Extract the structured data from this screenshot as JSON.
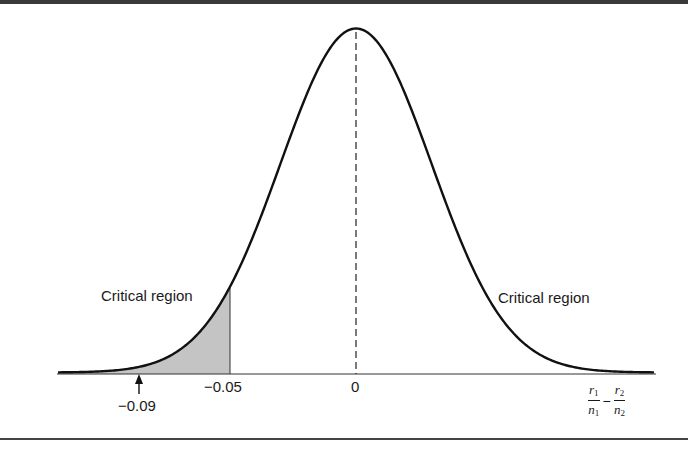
{
  "figure": {
    "colors": {
      "curve": "#111111",
      "shade": "#c4c4c4",
      "axis": "#333333",
      "border": "#444444",
      "text": "#1a1a1a"
    }
  },
  "labels": {
    "critical_left": "Critical region",
    "critical_right": "Critical region",
    "tick_zero": "0",
    "tick_cutoff": "−0.05",
    "arrow_value": "−0.09",
    "xlabel": {
      "r1": "r",
      "sub1": "1",
      "n1": "n",
      "subn1": "1",
      "minus": "−",
      "r2": "r",
      "sub2": "2",
      "n2": "n",
      "subn2": "2"
    }
  },
  "chart_data": {
    "type": "area",
    "title": "",
    "xlabel": "r1/n1 − r2/n2",
    "ylabel": "",
    "distribution": {
      "family": "normal",
      "mean": 0,
      "sd_approx": 0.03
    },
    "x_ticks": [
      {
        "value": -0.05,
        "label": "−0.05"
      },
      {
        "value": 0,
        "label": "0"
      }
    ],
    "shaded_region": {
      "from": "-inf",
      "to": -0.05,
      "label": "Critical region"
    },
    "annotations": [
      {
        "type": "arrow",
        "x": -0.09,
        "label": "−0.09",
        "meaning": "observed value"
      },
      {
        "type": "text",
        "label": "Critical region",
        "side": "left"
      },
      {
        "type": "text",
        "label": "Critical region",
        "side": "right"
      },
      {
        "type": "dashed_line",
        "x": 0,
        "meaning": "mean"
      }
    ],
    "grid": false,
    "legend": null
  }
}
